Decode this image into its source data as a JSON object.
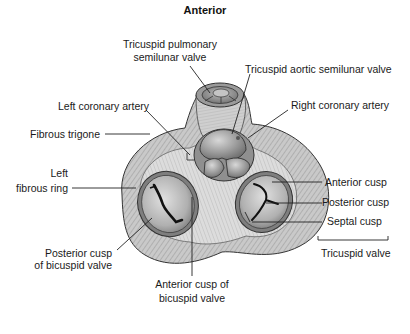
{
  "figure": {
    "title": "Anterior"
  },
  "labels": {
    "pulmonary_valve_line1": "Tricuspid pulmonary",
    "pulmonary_valve_line2": "semilunar valve",
    "aortic_valve": "Tricuspid aortic semilunar valve",
    "left_coronary_artery": "Left coronary artery",
    "right_coronary_artery": "Right coronary artery",
    "fibrous_trigone": "Fibrous trigone",
    "left_fibrous_ring_line1": "Left",
    "left_fibrous_ring_line2": "fibrous ring",
    "anterior_cusp": "Anterior cusp",
    "posterior_cusp": "Posterior cusp",
    "septal_cusp": "Septal cusp",
    "tricuspid_valve": "Tricuspid valve",
    "posterior_cusp_bicuspid_line1": "Posterior cusp",
    "posterior_cusp_bicuspid_line2": "of bicuspid valve",
    "anterior_cusp_bicuspid_line1": "Anterior cusp of",
    "anterior_cusp_bicuspid_line2": "bicuspid valve"
  },
  "colors": {
    "tissue_light": "#d4d4d4",
    "tissue_mid": "#a8a8a8",
    "tissue_dark": "#7a7a7a",
    "valve_fill": "#bdbdbd",
    "line": "#222222"
  }
}
